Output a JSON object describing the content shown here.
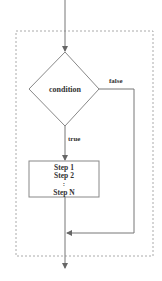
{
  "diagram": {
    "type": "flowchart-while-loop",
    "decision": {
      "label": "condition"
    },
    "branches": {
      "true_label": "true",
      "false_label": "false"
    },
    "process": {
      "lines": [
        "Step 1",
        "Step 2",
        ":",
        "Step N"
      ]
    },
    "colors": {
      "line": "#777777",
      "dashed_border": "#aaaaaa",
      "text": "#333333"
    }
  }
}
